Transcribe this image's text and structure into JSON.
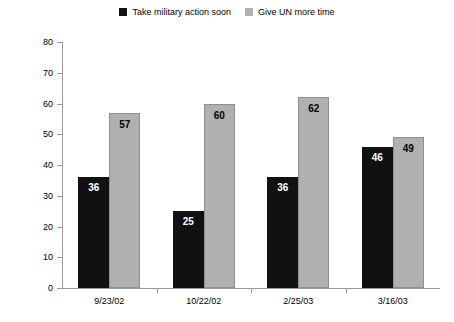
{
  "chart_data": {
    "type": "bar",
    "title": "",
    "subtitle": "",
    "xlabel": "",
    "ylabel": "Percentage supporting",
    "ylim": [
      0,
      80
    ],
    "yticks": [
      0,
      10,
      20,
      30,
      40,
      50,
      60,
      70,
      80
    ],
    "grid": false,
    "legend_position": "top-center",
    "categories": [
      "9/23/02",
      "10/22/02",
      "2/25/03",
      "3/16/03"
    ],
    "series": [
      {
        "name": "Take military action soon",
        "color": "#111111",
        "label_color": "#ffffff",
        "values": [
          36,
          25,
          36,
          46
        ]
      },
      {
        "name": "Give UN more time",
        "color": "#b0b0b0",
        "label_color": "#000000",
        "values": [
          57,
          60,
          62,
          49
        ]
      }
    ]
  }
}
